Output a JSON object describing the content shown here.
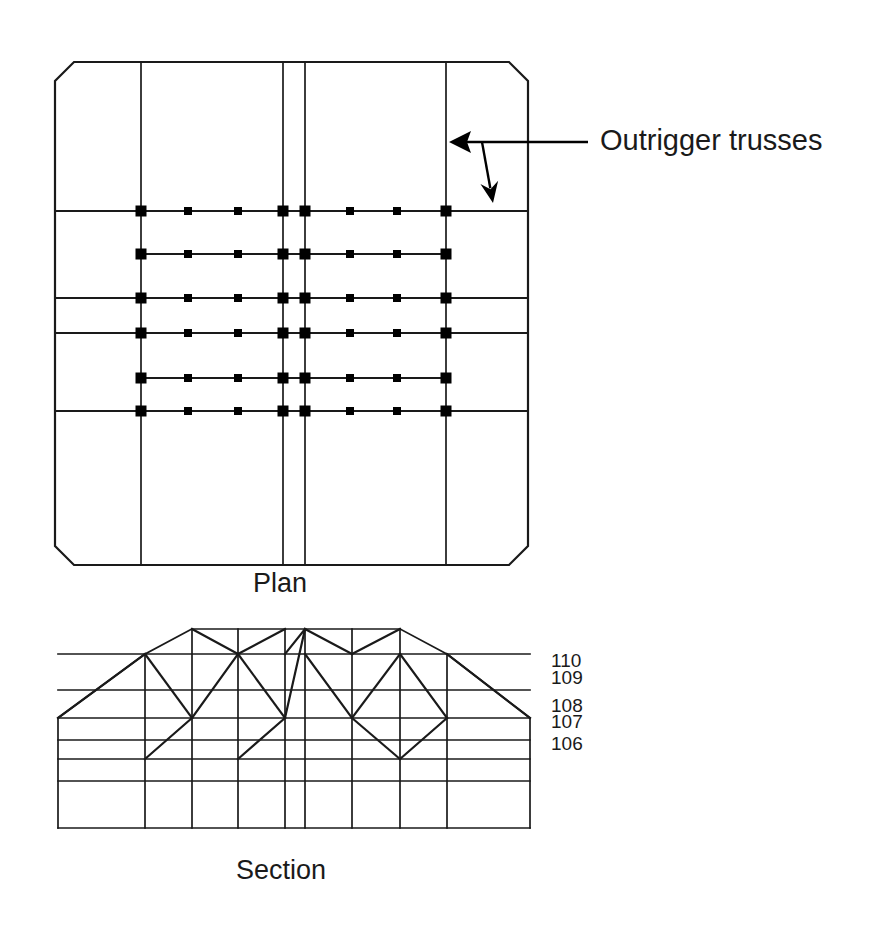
{
  "figure": {
    "background_color": "#ffffff",
    "line_color": "#1a1a1a",
    "node_color": "#000000"
  },
  "annotations": [
    {
      "id": "outrigger-callout",
      "label": "Outrigger trusses",
      "text_x": 600,
      "text_y": 142,
      "leader": {
        "start_x": 588,
        "start_y": 142,
        "end_x": 458,
        "end_y": 142,
        "branch_x": 482,
        "branch_y": 142,
        "branch_end_x": 493,
        "branch_end_y": 203
      }
    }
  ],
  "captions": [
    {
      "id": "plan-caption",
      "label": "Plan",
      "x": 253,
      "y": 585
    },
    {
      "id": "section-caption",
      "label": "Section",
      "x": 236,
      "y": 872
    }
  ],
  "plan": {
    "name": "Plan",
    "outline": {
      "left": 55,
      "right": 528,
      "top": 62,
      "bottom": 565,
      "chamfer": 19
    },
    "vertical_gridlines": [
      141,
      283,
      305,
      446
    ],
    "horizontal_gridlines_full": [
      211,
      298,
      333,
      411
    ],
    "truss_rows": [
      {
        "y": 211,
        "x_start": 55,
        "x_end": 528,
        "full_width": true
      },
      {
        "y": 254,
        "x_start": 141,
        "x_end": 446,
        "full_width": false
      },
      {
        "y": 298,
        "x_start": 55,
        "x_end": 528,
        "full_width": true
      },
      {
        "y": 333,
        "x_start": 55,
        "x_end": 528,
        "full_width": true
      },
      {
        "y": 378,
        "x_start": 141,
        "x_end": 446,
        "full_width": false
      },
      {
        "y": 411,
        "x_start": 55,
        "x_end": 528,
        "full_width": true
      }
    ],
    "node_columns": [
      141,
      188,
      238,
      283,
      305,
      350,
      397,
      446
    ],
    "node_rows": [
      211,
      254,
      298,
      333,
      378,
      411
    ],
    "node_size_major": 11,
    "node_size_minor": 8,
    "major_columns": [
      141,
      283,
      305,
      446
    ]
  },
  "section": {
    "name": "Section",
    "left": 58,
    "right": 530,
    "bottom": 828,
    "columns": [
      58,
      145,
      192,
      238,
      285,
      305,
      352,
      400,
      447,
      530
    ],
    "floor_lines": [
      {
        "y": 654,
        "x_start": 58,
        "x_end": 530,
        "label": "110",
        "label_x": 551,
        "label_y": 662
      },
      {
        "y": 690,
        "x_start": 58,
        "x_end": 530,
        "label": "109",
        "label_x": 551,
        "label_y": 679
      },
      {
        "y": 718,
        "x_start": 58,
        "x_end": 530,
        "label": "108",
        "label_x": 551,
        "label_y": 707
      },
      {
        "y": 740,
        "x_start": 58,
        "x_end": 530,
        "label": "107",
        "label_x": 551,
        "label_y": 723
      },
      {
        "y": 759,
        "x_start": 58,
        "x_end": 530,
        "label": "106",
        "label_x": 551,
        "label_y": 745
      },
      {
        "y": 781,
        "x_start": 58,
        "x_end": 530,
        "label": "",
        "label_x": 0,
        "label_y": 0
      }
    ],
    "top_chord": {
      "y": 629,
      "x_start": 192,
      "x_end": 400
    },
    "roof_slopes": [
      {
        "x1": 58,
        "y1": 718,
        "x2": 145,
        "y2": 654
      },
      {
        "x1": 145,
        "y1": 654,
        "x2": 192,
        "y2": 629
      },
      {
        "x1": 400,
        "y1": 629,
        "x2": 447,
        "y2": 654
      },
      {
        "x1": 447,
        "y1": 654,
        "x2": 530,
        "y2": 718
      }
    ],
    "diagonals": [
      {
        "x1": 58,
        "y1": 718,
        "x2": 145,
        "y2": 654
      },
      {
        "x1": 145,
        "y1": 654,
        "x2": 192,
        "y2": 718
      },
      {
        "x1": 192,
        "y1": 629,
        "x2": 238,
        "y2": 654
      },
      {
        "x1": 238,
        "y1": 654,
        "x2": 285,
        "y2": 629
      },
      {
        "x1": 192,
        "y1": 718,
        "x2": 145,
        "y2": 759
      },
      {
        "x1": 192,
        "y1": 718,
        "x2": 238,
        "y2": 654
      },
      {
        "x1": 238,
        "y1": 654,
        "x2": 285,
        "y2": 718
      },
      {
        "x1": 285,
        "y1": 718,
        "x2": 238,
        "y2": 759
      },
      {
        "x1": 285,
        "y1": 718,
        "x2": 305,
        "y2": 629
      },
      {
        "x1": 305,
        "y1": 629,
        "x2": 285,
        "y2": 654
      },
      {
        "x1": 305,
        "y1": 654,
        "x2": 352,
        "y2": 718
      },
      {
        "x1": 352,
        "y1": 718,
        "x2": 400,
        "y2": 654
      },
      {
        "x1": 305,
        "y1": 629,
        "x2": 352,
        "y2": 654
      },
      {
        "x1": 352,
        "y1": 654,
        "x2": 400,
        "y2": 629
      },
      {
        "x1": 352,
        "y1": 718,
        "x2": 400,
        "y2": 759
      },
      {
        "x1": 400,
        "y1": 654,
        "x2": 447,
        "y2": 718
      },
      {
        "x1": 447,
        "y1": 718,
        "x2": 400,
        "y2": 759
      },
      {
        "x1": 447,
        "y1": 654,
        "x2": 530,
        "y2": 718
      }
    ]
  }
}
